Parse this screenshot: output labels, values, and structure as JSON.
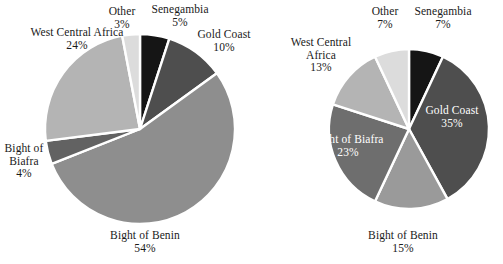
{
  "figure": {
    "width": 503,
    "height": 264,
    "background": "#ffffff",
    "text_color": "#1a1a1a",
    "inner_label_color": "#ffffff",
    "slice_border_color": "#ffffff"
  },
  "chart_data": [
    {
      "type": "pie",
      "title": "",
      "subtitle": "",
      "xlabel": "",
      "ylabel": "",
      "legend_position": "none",
      "grid": false,
      "labels_on_slices": true,
      "start_angle_deg": 0,
      "direction": "clockwise",
      "center": {
        "x": 140,
        "y": 129
      },
      "radius": 95,
      "categories": [
        "Senegambia",
        "Gold Coast",
        "Bight of Benin",
        "Bight of Biafra",
        "West Central Africa",
        "Other"
      ],
      "values": [
        5,
        10,
        54,
        4,
        24,
        3
      ],
      "value_unit": "%",
      "colors": [
        "#151515",
        "#4e4e4e",
        "#8e8e8e",
        "#626262",
        "#b4b4b4",
        "#dcdcdc"
      ],
      "slices": [
        {
          "name": "Senegambia",
          "value": 5,
          "label": "Senegambia",
          "pct": "5%",
          "color": "#151515",
          "label_placement": "outside",
          "label_color": "#1a1a1a"
        },
        {
          "name": "Gold Coast",
          "value": 10,
          "label": "Gold Coast",
          "pct": "10%",
          "color": "#4e4e4e",
          "label_placement": "outside",
          "label_color": "#1a1a1a"
        },
        {
          "name": "Bight of Benin",
          "value": 54,
          "label": "Bight of Benin",
          "pct": "54%",
          "color": "#8e8e8e",
          "label_placement": "outside",
          "label_color": "#1a1a1a"
        },
        {
          "name": "Bight of Biafra",
          "value": 4,
          "label": "Bight of\nBiafra",
          "pct": "4%",
          "color": "#626262",
          "label_placement": "outside",
          "label_color": "#1a1a1a"
        },
        {
          "name": "West Central Africa",
          "value": 24,
          "label": "West Central Africa",
          "pct": "24%",
          "color": "#b4b4b4",
          "label_placement": "outside",
          "label_color": "#1a1a1a"
        },
        {
          "name": "Other",
          "value": 3,
          "label": "Other",
          "pct": "3%",
          "color": "#dcdcdc",
          "label_placement": "outside",
          "label_color": "#1a1a1a"
        }
      ]
    },
    {
      "type": "pie",
      "title": "",
      "subtitle": "",
      "xlabel": "",
      "ylabel": "",
      "legend_position": "none",
      "grid": false,
      "labels_on_slices": true,
      "start_angle_deg": 0,
      "direction": "clockwise",
      "center": {
        "x": 409,
        "y": 129
      },
      "radius": 80,
      "categories": [
        "Senegambia",
        "Gold Coast",
        "Bight of Benin",
        "Bight of Biafra",
        "West Central Africa",
        "Other"
      ],
      "values": [
        7,
        35,
        15,
        23,
        13,
        7
      ],
      "value_unit": "%",
      "colors": [
        "#151515",
        "#4e4e4e",
        "#9a9a9a",
        "#6e6e6e",
        "#b4b4b4",
        "#dcdcdc"
      ],
      "slices": [
        {
          "name": "Senegambia",
          "value": 7,
          "label": "Senegambia",
          "pct": "7%",
          "color": "#151515",
          "label_placement": "outside",
          "label_color": "#1a1a1a"
        },
        {
          "name": "Gold Coast",
          "value": 35,
          "label": "Gold Coast",
          "pct": "35%",
          "color": "#4e4e4e",
          "label_placement": "inside",
          "label_color": "#ffffff"
        },
        {
          "name": "Bight of Benin",
          "value": 15,
          "label": "Bight of Benin",
          "pct": "15%",
          "color": "#9a9a9a",
          "label_placement": "outside",
          "label_color": "#1a1a1a"
        },
        {
          "name": "Bight of Biafra",
          "value": 23,
          "label": "Bight of Biafra",
          "pct": "23%",
          "color": "#6e6e6e",
          "label_placement": "inside",
          "label_color": "#ffffff"
        },
        {
          "name": "West Central Africa",
          "value": 13,
          "label": "West Central\nAfrica",
          "pct": "13%",
          "color": "#b4b4b4",
          "label_placement": "outside",
          "label_color": "#1a1a1a"
        },
        {
          "name": "Other",
          "value": 7,
          "label": "Other",
          "pct": "7%",
          "color": "#dcdcdc",
          "label_placement": "outside",
          "label_color": "#1a1a1a"
        }
      ]
    }
  ],
  "left_chart_labels": {
    "west_central_africa": {
      "name": "West Central Africa",
      "pct": "24%"
    },
    "other": {
      "name": "Other",
      "pct": "3%"
    },
    "senegambia": {
      "name": "Senegambia",
      "pct": "5%"
    },
    "gold_coast": {
      "name": "Gold Coast",
      "pct": "10%"
    },
    "bight_of_biafra": {
      "line1": "Bight of",
      "line2": "Biafra",
      "pct": "4%"
    },
    "bight_of_benin": {
      "name": "Bight of Benin",
      "pct": "54%"
    }
  },
  "right_chart_labels": {
    "other": {
      "name": "Other",
      "pct": "7%"
    },
    "senegambia": {
      "name": "Senegambia",
      "pct": "7%"
    },
    "west_central_africa": {
      "line1": "West Central",
      "line2": "Africa",
      "pct": "13%"
    },
    "gold_coast": {
      "name": "Gold Coast",
      "pct": "35%"
    },
    "bight_of_biafra": {
      "name": "Bight of Biafra",
      "pct": "23%"
    },
    "bight_of_benin": {
      "name": "Bight of Benin",
      "pct": "15%"
    }
  }
}
